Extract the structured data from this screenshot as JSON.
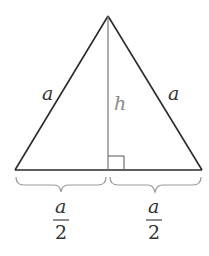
{
  "diagram": {
    "type": "equilateral-triangle-with-altitude",
    "side_left_label": "a",
    "side_right_label": "a",
    "height_label": "h",
    "half_base_left": {
      "numerator": "a",
      "denominator": "2"
    },
    "half_base_right": {
      "numerator": "a",
      "denominator": "2"
    },
    "colors": {
      "edge": "#2a2a2a",
      "altitude": "#777777",
      "height_label": "#8a8a8a",
      "brace": "#9a9a9a",
      "text": "#333333"
    }
  }
}
